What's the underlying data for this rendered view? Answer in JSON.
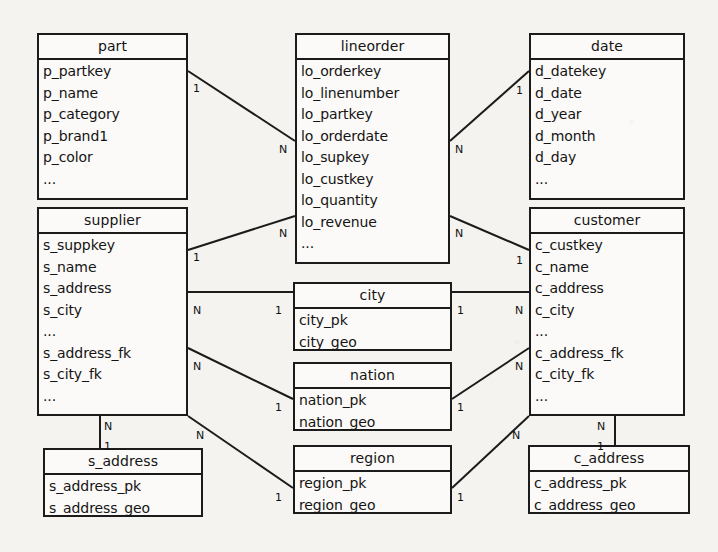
{
  "diagram": {
    "kind": "entity-relationship-diagram",
    "title": "",
    "line_color": "#1b1b1b",
    "box_fill": "#fbfaf8",
    "background": "#f4f3f0",
    "entities": [
      {
        "id": "part",
        "name": "part",
        "fields": [
          "p_partkey",
          "p_name",
          "p_category",
          "p_brand1",
          "p_color",
          "..."
        ],
        "x": 37,
        "y": 33,
        "w": 151,
        "h": 167
      },
      {
        "id": "lineorder",
        "name": "lineorder",
        "fields": [
          "lo_orderkey",
          "lo_linenumber",
          "lo_partkey",
          "lo_orderdate",
          "lo_supkey",
          "lo_custkey",
          "lo_quantity",
          "lo_revenue",
          "..."
        ],
        "x": 295,
        "y": 33,
        "w": 155,
        "h": 231
      },
      {
        "id": "date",
        "name": "date",
        "fields": [
          "d_datekey",
          "d_date",
          "d_year",
          "d_month",
          "d_day",
          "..."
        ],
        "x": 529,
        "y": 33,
        "w": 156,
        "h": 167
      },
      {
        "id": "supplier",
        "name": "supplier",
        "fields": [
          "s_suppkey",
          "s_name",
          "s_address",
          "s_city",
          "...",
          "s_address_fk",
          "s_city_fk",
          "..."
        ],
        "x": 37,
        "y": 207,
        "w": 151,
        "h": 209
      },
      {
        "id": "customer",
        "name": "customer",
        "fields": [
          "c_custkey",
          "c_name",
          "c_address",
          "c_city",
          "...",
          "c_address_fk",
          "c_city_fk",
          "..."
        ],
        "x": 529,
        "y": 207,
        "w": 156,
        "h": 209
      },
      {
        "id": "city",
        "name": "city",
        "fields": [
          "city_pk",
          "city_geo"
        ],
        "x": 293,
        "y": 282,
        "w": 159,
        "h": 69
      },
      {
        "id": "nation",
        "name": "nation",
        "fields": [
          "nation_pk",
          "nation_geo"
        ],
        "x": 293,
        "y": 362,
        "w": 159,
        "h": 69
      },
      {
        "id": "region",
        "name": "region",
        "fields": [
          "region_pk",
          "region_geo"
        ],
        "x": 293,
        "y": 445,
        "w": 159,
        "h": 69
      },
      {
        "id": "s_address",
        "name": "s_address",
        "fields": [
          "s_address_pk",
          "s_address_geo"
        ],
        "x": 43,
        "y": 448,
        "w": 160,
        "h": 69
      },
      {
        "id": "c_address",
        "name": "c_address",
        "fields": [
          "c_address_pk",
          "c_address_geo"
        ],
        "x": 528,
        "y": 445,
        "w": 162,
        "h": 69
      }
    ],
    "relationships": [
      {
        "id": "part-lineorder",
        "from": "part",
        "to": "lineorder",
        "from_card": "1",
        "to_card": "N",
        "x1": 188,
        "y1": 71,
        "x2": 295,
        "y2": 141
      },
      {
        "id": "supplier-lineorder",
        "from": "supplier",
        "to": "lineorder",
        "from_card": "1",
        "to_card": "N",
        "x1": 188,
        "y1": 250,
        "x2": 295,
        "y2": 216
      },
      {
        "id": "lineorder-date",
        "from": "lineorder",
        "to": "date",
        "from_card": "N",
        "to_card": "1",
        "x1": 450,
        "y1": 141,
        "x2": 529,
        "y2": 71
      },
      {
        "id": "lineorder-customer",
        "from": "lineorder",
        "to": "customer",
        "from_card": "N",
        "to_card": "1",
        "x1": 450,
        "y1": 216,
        "x2": 529,
        "y2": 250
      },
      {
        "id": "supplier-city",
        "from": "supplier",
        "to": "city",
        "from_card": "N",
        "to_card": "1",
        "x1": 188,
        "y1": 292,
        "x2": 293,
        "y2": 292
      },
      {
        "id": "city-customer",
        "from": "city",
        "to": "customer",
        "from_card": "1",
        "to_card": "N",
        "x1": 452,
        "y1": 292,
        "x2": 529,
        "y2": 292
      },
      {
        "id": "supplier-nation",
        "from": "supplier",
        "to": "nation",
        "from_card": "N",
        "to_card": "1",
        "x1": 188,
        "y1": 348,
        "x2": 293,
        "y2": 399
      },
      {
        "id": "nation-customer",
        "from": "nation",
        "to": "customer",
        "from_card": "1",
        "to_card": "N",
        "x1": 452,
        "y1": 399,
        "x2": 529,
        "y2": 348
      },
      {
        "id": "supplier-region",
        "from": "supplier",
        "to": "region",
        "from_card": "N",
        "to_card": "1",
        "x1": 188,
        "y1": 416,
        "x2": 293,
        "y2": 488
      },
      {
        "id": "region-customer",
        "from": "region",
        "to": "customer",
        "from_card": "1",
        "to_card": "N",
        "x1": 452,
        "y1": 488,
        "x2": 529,
        "y2": 416
      },
      {
        "id": "supplier-s_address",
        "from": "supplier",
        "to": "s_address",
        "from_card": "N",
        "to_card": "1",
        "x1": 100,
        "y1": 416,
        "x2": 100,
        "y2": 448
      },
      {
        "id": "customer-c_address",
        "from": "customer",
        "to": "c_address",
        "from_card": "N",
        "to_card": "1",
        "x1": 615,
        "y1": 416,
        "x2": 615,
        "y2": 445
      }
    ],
    "cardinality_labels": [
      {
        "text": "1",
        "x": 193,
        "y": 83
      },
      {
        "text": "N",
        "x": 279,
        "y": 144
      },
      {
        "text": "1",
        "x": 193,
        "y": 252
      },
      {
        "text": "N",
        "x": 279,
        "y": 228
      },
      {
        "text": "N",
        "x": 455,
        "y": 144
      },
      {
        "text": "1",
        "x": 516,
        "y": 85
      },
      {
        "text": "N",
        "x": 455,
        "y": 228
      },
      {
        "text": "1",
        "x": 516,
        "y": 255
      },
      {
        "text": "N",
        "x": 193,
        "y": 305
      },
      {
        "text": "1",
        "x": 275,
        "y": 305
      },
      {
        "text": "1",
        "x": 457,
        "y": 305
      },
      {
        "text": "N",
        "x": 515,
        "y": 305
      },
      {
        "text": "N",
        "x": 193,
        "y": 361
      },
      {
        "text": "1",
        "x": 275,
        "y": 402
      },
      {
        "text": "1",
        "x": 457,
        "y": 402
      },
      {
        "text": "N",
        "x": 515,
        "y": 361
      },
      {
        "text": "N",
        "x": 196,
        "y": 430
      },
      {
        "text": "1",
        "x": 275,
        "y": 492
      },
      {
        "text": "1",
        "x": 457,
        "y": 492
      },
      {
        "text": "N",
        "x": 512,
        "y": 430
      },
      {
        "text": "N",
        "x": 104,
        "y": 421
      },
      {
        "text": "1",
        "x": 104,
        "y": 441
      },
      {
        "text": "N",
        "x": 597,
        "y": 421
      },
      {
        "text": "1",
        "x": 597,
        "y": 441
      }
    ]
  }
}
